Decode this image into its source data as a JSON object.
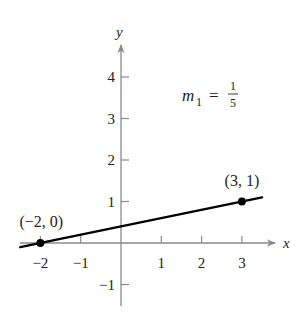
{
  "chart_data": {
    "type": "line",
    "title": "",
    "xlabel": "x",
    "ylabel": "y",
    "xlim": [
      -2.5,
      3.8
    ],
    "ylim": [
      -1.5,
      4.7
    ],
    "grid": false,
    "x_ticks": [
      -2,
      -1,
      1,
      2,
      3
    ],
    "x_tick_labels": [
      "−2",
      "−1",
      "1",
      "2",
      "3"
    ],
    "y_ticks": [
      -1,
      1,
      2,
      3,
      4
    ],
    "y_tick_labels": [
      "−1",
      "1",
      "2",
      "3",
      "4"
    ],
    "series": [
      {
        "name": "line through (-2, 0) and (3, 1)",
        "slope": 0.2,
        "intercept": 0.4,
        "x": [
          -2.5,
          3.5
        ],
        "y": [
          -0.1,
          1.1
        ],
        "color": "#000000"
      }
    ],
    "points": [
      {
        "x": -2,
        "y": 0,
        "label": "(−2, 0)"
      },
      {
        "x": 3,
        "y": 1,
        "label": "(3, 1)"
      }
    ],
    "annotations": [
      {
        "text": "m",
        "subscript": "1",
        "equals": "=",
        "numerator": "1",
        "denominator": "5"
      }
    ]
  },
  "colors": {
    "axis": "#8a8a8a",
    "line": "#000000",
    "text": "#222222"
  }
}
